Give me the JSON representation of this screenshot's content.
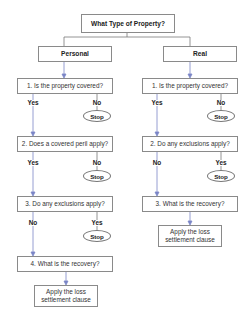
{
  "title": "What Type of Property?",
  "colors": {
    "connector": "#7a7a7a",
    "arrow": "#7b86c6",
    "box_border": "#8a8a8a"
  },
  "branches": [
    {
      "name": "Personal",
      "q1": "1. Is the property covered?",
      "q1_yes": "Yes",
      "q1_no": "No",
      "q1_stop": "Stop",
      "q2": "2. Does a covered peril apply?",
      "q2_yes": "Yes",
      "q2_no": "No",
      "q2_stop": "Stop",
      "q3": "3. Do any exclusions apply?",
      "q3_no": "No",
      "q3_yes": "Yes",
      "q3_stop": "Stop",
      "q4": "4. What is the recovery?",
      "result_line1": "Apply the loss",
      "result_line2": "settlement clause"
    },
    {
      "name": "Real",
      "q1": "1. Is the property covered?",
      "q1_yes": "Yes",
      "q1_no": "No",
      "q1_stop": "Stop",
      "q2": "2. Do any exclusions apply?",
      "q2_no": "No",
      "q2_yes": "Yes",
      "q2_stop": "Stop",
      "q3": "3. What is the recovery?",
      "result_line1": "Apply the loss",
      "result_line2": "settlement clause"
    }
  ]
}
